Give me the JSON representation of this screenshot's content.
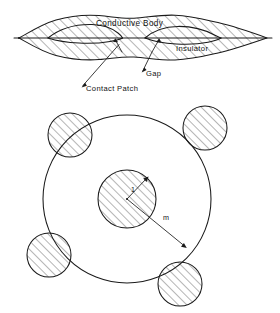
{
  "figure": {
    "background_color": "#ffffff",
    "line_color": "#1a1a1a",
    "hatch_color": "#3a3a3a",
    "width": 280,
    "height": 313
  },
  "top_diagram": {
    "name": "conductive-body-cross-section",
    "labels": {
      "conductive_body": "Conductive Body",
      "insulator": "Insulator",
      "gap": "Gap",
      "contact_patch": "Contact Patch"
    },
    "label_positions": {
      "conductive_body": {
        "x": 96,
        "y": 23
      },
      "insulator": {
        "x": 178,
        "y": 48
      },
      "gap": {
        "x": 145,
        "y": 73
      },
      "contact_patch": {
        "x": 85,
        "y": 88
      }
    },
    "body_extent": {
      "x_left": 18,
      "x_right": 268,
      "y_top": 14,
      "y_bottom": 58
    },
    "centerline_y": 38,
    "hatching": "diagonal-lower-left-to-upper-right",
    "insulator_lens_count": 2,
    "gap_arrow_count": 2
  },
  "bottom_diagram": {
    "name": "concentric-circle-contact-model",
    "outer_circle": {
      "cx": 127,
      "cy": 199,
      "r": 84,
      "fill": "none"
    },
    "inner_circle": {
      "cx": 127,
      "cy": 199,
      "r": 29,
      "fill": "hatched"
    },
    "radius_labels": {
      "inner_radius": "1",
      "outer_radius": "m"
    },
    "label_positions": {
      "inner_radius": {
        "x": 130,
        "y": 190
      },
      "outer_radius": {
        "x": 164,
        "y": 217
      }
    },
    "satellite_circles": [
      {
        "name": "satellite-upper-left",
        "cx": 70,
        "cy": 135,
        "r": 22
      },
      {
        "name": "satellite-upper-right",
        "cx": 205,
        "cy": 128,
        "r": 22
      },
      {
        "name": "satellite-lower-left",
        "cx": 49,
        "cy": 255,
        "r": 22
      },
      {
        "name": "satellite-lower-right",
        "cx": 180,
        "cy": 284,
        "r": 22
      }
    ],
    "hatching": "diagonal-lower-left-to-upper-right"
  }
}
